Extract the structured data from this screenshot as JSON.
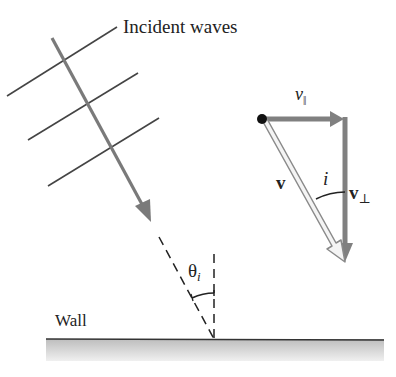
{
  "diagram": {
    "title": "Incident waves",
    "wall_label": "Wall",
    "velocity_parallel": {
      "symbol": "v",
      "subscript": "||"
    },
    "velocity_label": "v",
    "angle_label": "i",
    "velocity_perpendicular": {
      "symbol": "v",
      "subscript": "⊥"
    },
    "incidence_angle": {
      "symbol": "θ",
      "subscript": "i"
    },
    "colors": {
      "wavefront": "#444444",
      "ray_arrow": "#7a7a7a",
      "component_arrow": "#808080",
      "velocity_arrow_fill": "#f4f4f4",
      "velocity_arrow_stroke": "#8a8a8a",
      "wall_top": "#c8c8c8",
      "wall_bottom": "#eeeeee",
      "origin_dot": "#111111"
    }
  }
}
